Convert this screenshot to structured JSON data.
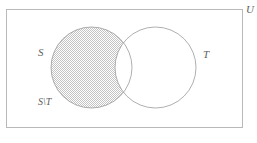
{
  "figure": {
    "type": "venn-diagram",
    "universe_label": "U",
    "left_set_label": "S",
    "right_set_label": "T",
    "shaded_region_label": "S\\T",
    "caption": "",
    "colors": {
      "outline": "#b9b9b9",
      "circle_stroke": "#9a9a9a",
      "hatch": "#c9c9c9",
      "label_text": "#5e5e5e",
      "background": "#ffffff"
    },
    "geometry": {
      "rect": {
        "x": 6,
        "y": 9,
        "width": 237,
        "height": 119
      },
      "left_circle": {
        "cx": 91.5,
        "cy": 67.5,
        "r": 40.5
      },
      "right_circle": {
        "cx": 155.5,
        "cy": 67.5,
        "r": 40.5
      },
      "shaded": "left-circle-minus-right-circle"
    }
  }
}
